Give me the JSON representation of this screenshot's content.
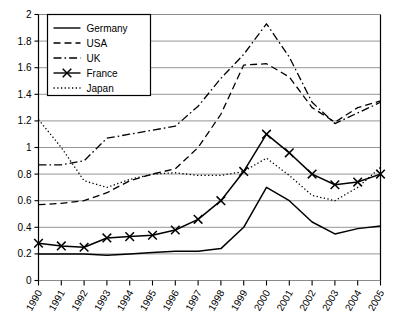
{
  "chart_data": {
    "type": "line",
    "title": "",
    "subtitle": "",
    "xlabel": "",
    "ylabel": "",
    "x": [
      "1990",
      "1991",
      "1992",
      "1993",
      "1994",
      "1995",
      "1996",
      "1997",
      "1998",
      "1999",
      "2000",
      "2001",
      "2002",
      "2003",
      "2004",
      "2005"
    ],
    "categories": [
      "1990",
      "1991",
      "1992",
      "1993",
      "1994",
      "1995",
      "1996",
      "1997",
      "1998",
      "1999",
      "2000",
      "2001",
      "2002",
      "2003",
      "2004",
      "2005"
    ],
    "ylim": [
      0,
      2
    ],
    "xlim": [
      0,
      15
    ],
    "ytick_labels": [
      "0",
      "0.2",
      "0.4",
      "0.6",
      "0.8",
      "1",
      "1.2",
      "1.4",
      "1.6",
      "1.8",
      "2"
    ],
    "ytick_values": [
      0,
      0.2,
      0.4,
      0.6,
      0.8,
      1,
      1.2,
      1.4,
      1.6,
      1.8,
      2
    ],
    "ytick_step": 0.2,
    "grid": true,
    "grid_axis": "y",
    "legend_position": "top-left",
    "series": [
      {
        "name": "Germany",
        "style": "solid",
        "marker": "none",
        "color": "#000000",
        "values": [
          0.2,
          0.2,
          0.2,
          0.19,
          0.2,
          0.21,
          0.22,
          0.22,
          0.24,
          0.4,
          0.7,
          0.6,
          0.44,
          0.35,
          0.39,
          0.41
        ]
      },
      {
        "name": "USA",
        "style": "dashed",
        "marker": "none",
        "color": "#000000",
        "values": [
          0.57,
          0.58,
          0.6,
          0.66,
          0.75,
          0.8,
          0.84,
          1.0,
          1.25,
          1.62,
          1.63,
          1.53,
          1.3,
          1.19,
          1.3,
          1.35
        ]
      },
      {
        "name": "UK",
        "style": "dash-dot",
        "marker": "none",
        "color": "#000000",
        "values": [
          0.87,
          0.87,
          0.9,
          1.07,
          1.1,
          1.13,
          1.16,
          1.31,
          1.52,
          1.7,
          1.93,
          1.68,
          1.34,
          1.18,
          1.26,
          1.34
        ]
      },
      {
        "name": "France",
        "style": "solid",
        "marker": "x",
        "color": "#000000",
        "values": [
          0.28,
          0.26,
          0.25,
          0.32,
          0.33,
          0.34,
          0.38,
          0.46,
          0.6,
          0.82,
          1.1,
          0.96,
          0.8,
          0.72,
          0.74,
          0.8
        ]
      },
      {
        "name": "Japan",
        "style": "dotted",
        "marker": "none",
        "color": "#000000",
        "values": [
          1.21,
          1.0,
          0.75,
          0.7,
          0.76,
          0.8,
          0.81,
          0.79,
          0.79,
          0.82,
          0.92,
          0.79,
          0.64,
          0.6,
          0.7,
          0.85
        ]
      }
    ]
  },
  "legend": {
    "items": [
      {
        "label": "Germany"
      },
      {
        "label": "USA"
      },
      {
        "label": "UK"
      },
      {
        "label": "France"
      },
      {
        "label": "Japan"
      }
    ]
  }
}
